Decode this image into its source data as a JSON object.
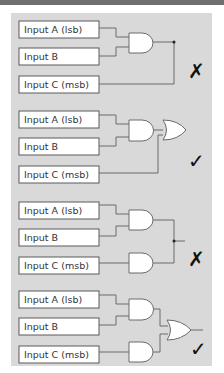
{
  "colors": {
    "top_band": "#6f6f6f",
    "panel_background": "#d9d9d9",
    "box_fill": "#ffffff",
    "wire": "#6a6a6a",
    "mark": "#111111"
  },
  "circuits": [
    {
      "inputs": [
        "Input A (lsb)",
        "Input B",
        "Input C (msb)"
      ],
      "gates": [
        "AND(A,B)",
        "wired junction with C"
      ],
      "result_mark": "✗",
      "result": "incorrect"
    },
    {
      "inputs": [
        "Input A (lsb)",
        "Input B",
        "Input C (msb)"
      ],
      "gates": [
        "AND(A,B)",
        "OR(AND, C)"
      ],
      "result_mark": "✓",
      "result": "correct"
    },
    {
      "inputs": [
        "Input A (lsb)",
        "Input B",
        "Input C (msb)"
      ],
      "gates": [
        "AND(A,B)",
        "AND(C)",
        "wired junction"
      ],
      "result_mark": "✗",
      "result": "incorrect"
    },
    {
      "inputs": [
        "Input A (lsb)",
        "Input B",
        "Input C (msb)"
      ],
      "gates": [
        "AND(A,B)",
        "AND(C)",
        "OR(AND, AND)"
      ],
      "result_mark": "✓",
      "result": "correct"
    }
  ]
}
